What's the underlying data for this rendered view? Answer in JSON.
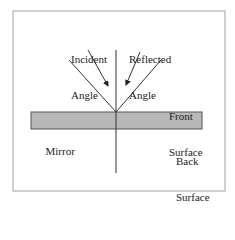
{
  "diagram": {
    "labels": {
      "incident_line1": "Incident",
      "incident_line2": "Angle",
      "reflected_line1": "Reflected",
      "reflected_line2": "Angle",
      "front_line1": "Front",
      "front_line2": "Surface",
      "back_line1": "Back",
      "back_line2": "Surface",
      "mirror": "Mirror"
    },
    "colors": {
      "frame": "#a0a0a0",
      "mirror_fill": "#b8b8b8",
      "mirror_stroke": "#555555",
      "line": "#333333"
    }
  }
}
